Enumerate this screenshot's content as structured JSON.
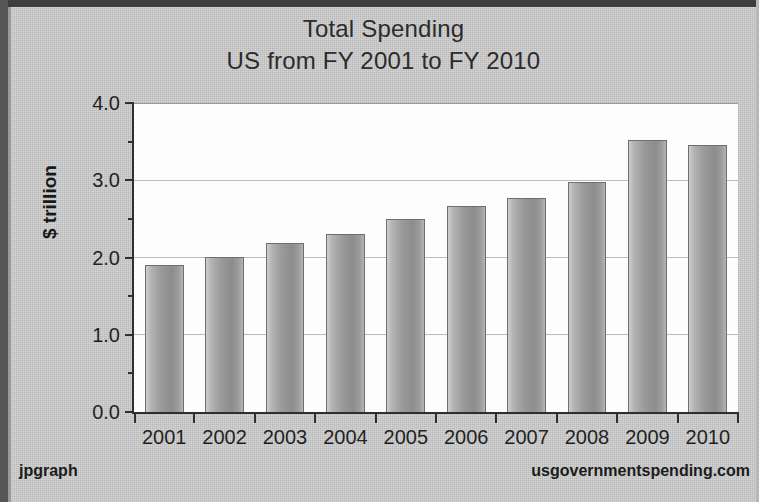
{
  "chart_data": {
    "type": "bar",
    "title": "Total Spending",
    "subtitle": "US from FY 2001 to FY 2010",
    "xlabel": "",
    "ylabel": "$ trillion",
    "categories": [
      "2001",
      "2002",
      "2003",
      "2004",
      "2005",
      "2006",
      "2007",
      "2008",
      "2009",
      "2010"
    ],
    "values": [
      1.9,
      2.01,
      2.19,
      2.31,
      2.5,
      2.67,
      2.77,
      2.98,
      3.52,
      3.46
    ],
    "ylim": [
      0.0,
      4.0
    ],
    "ytick_labels": [
      "0.0",
      "1.0",
      "2.0",
      "3.0",
      "4.0"
    ],
    "ytick_values": [
      0.0,
      1.0,
      2.0,
      3.0,
      4.0
    ],
    "yminor_values": [
      0.5,
      1.5,
      2.5,
      3.5
    ],
    "grid": "horizontal-major",
    "legend": "none",
    "bar_color": "#9a9a9a",
    "bar_border_color": "#6f6f6f",
    "plot_background": "#ffffff",
    "canvas_background": "#cacaca",
    "grid_color": "#bdbdbd",
    "axis_color": "#2e2e2e"
  },
  "footer": {
    "library": "jpgraph",
    "source": "usgovernmentspending.com"
  }
}
